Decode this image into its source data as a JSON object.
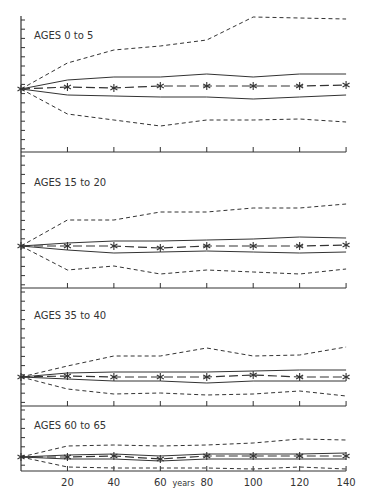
{
  "chart_data": {
    "type": "line",
    "title": "",
    "xlabel": "years",
    "ylabel": "",
    "x": [
      0,
      20,
      40,
      60,
      80,
      100,
      120,
      140
    ],
    "x_tick_labels": [
      "20",
      "40",
      "60",
      "80",
      "100",
      "120",
      "140"
    ],
    "xlim": [
      0,
      140
    ],
    "grid": false,
    "legend": null,
    "series_styles": {
      "mean": "long-dash with asterisk markers",
      "inner_band": "solid",
      "outer_band": "short-dash"
    },
    "panels": [
      {
        "label": "AGES 0 to 5",
        "note": "values are relative vertical offsets from origin (pixels, up positive)",
        "series": [
          {
            "name": "outer_upper",
            "values": [
              0,
              26,
              39,
              43,
              49,
              72,
              71,
              70
            ]
          },
          {
            "name": "inner_upper",
            "values": [
              0,
              9,
              12,
              12,
              15,
              12,
              15,
              15
            ]
          },
          {
            "name": "mean",
            "values": [
              0,
              2,
              1,
              3,
              3,
              3,
              3,
              4
            ]
          },
          {
            "name": "inner_lower",
            "values": [
              0,
              -6,
              -7,
              -8,
              -8,
              -10,
              -8,
              -6
            ]
          },
          {
            "name": "outer_lower",
            "values": [
              0,
              -25,
              -31,
              -37,
              -31,
              -31,
              -30,
              -33
            ]
          }
        ]
      },
      {
        "label": "AGES 15 to 20",
        "series": [
          {
            "name": "outer_upper",
            "values": [
              0,
              26,
              26,
              34,
              34,
              38,
              38,
              42
            ]
          },
          {
            "name": "inner_upper",
            "values": [
              0,
              3,
              5,
              5,
              6,
              7,
              9,
              8
            ]
          },
          {
            "name": "mean",
            "values": [
              0,
              0,
              0,
              -2,
              0,
              0,
              0,
              1
            ]
          },
          {
            "name": "inner_lower",
            "values": [
              0,
              -4,
              -7,
              -6,
              -5,
              -6,
              -7,
              -6
            ]
          },
          {
            "name": "outer_lower",
            "values": [
              0,
              -24,
              -20,
              -28,
              -24,
              -26,
              -28,
              -23
            ]
          }
        ]
      },
      {
        "label": "AGES 35 to 40",
        "series": [
          {
            "name": "outer_upper",
            "values": [
              0,
              11,
              21,
              21,
              29,
              21,
              22,
              30
            ]
          },
          {
            "name": "inner_upper",
            "values": [
              0,
              4,
              5,
              5,
              5,
              6,
              7,
              7
            ]
          },
          {
            "name": "mean",
            "values": [
              0,
              1,
              0,
              0,
              0,
              2,
              0,
              0
            ]
          },
          {
            "name": "inner_lower",
            "values": [
              0,
              -2,
              -4,
              -4,
              -6,
              -4,
              -4,
              -4
            ]
          },
          {
            "name": "outer_lower",
            "values": [
              0,
              -12,
              -17,
              -16,
              -18,
              -17,
              -14,
              -19
            ]
          }
        ]
      },
      {
        "label": "AGES 60 to 65",
        "series": [
          {
            "name": "outer_upper",
            "values": [
              0,
              11,
              12,
              11,
              12,
              14,
              18,
              17
            ]
          },
          {
            "name": "inner_upper",
            "values": [
              0,
              2,
              3,
              1,
              3,
              3,
              3,
              4
            ]
          },
          {
            "name": "mean",
            "values": [
              0,
              0,
              1,
              -2,
              1,
              1,
              1,
              1
            ]
          },
          {
            "name": "inner_lower",
            "values": [
              0,
              -2,
              -2,
              -4,
              -2,
              -2,
              -2,
              -2
            ]
          },
          {
            "name": "outer_lower",
            "values": [
              0,
              -10,
              -11,
              -11,
              -11,
              -12,
              -10,
              -12
            ]
          }
        ]
      }
    ]
  },
  "layout": {
    "x_axis_px": {
      "x0": 21,
      "px_per_unit": 2.322
    },
    "panels_px": [
      {
        "top": 16,
        "bottom": 152,
        "origin_y": 89,
        "label_y": 39
      },
      {
        "top": 152,
        "bottom": 288,
        "origin_y": 246,
        "label_y": 186
      },
      {
        "top": 288,
        "bottom": 406,
        "origin_y": 377,
        "label_y": 319
      },
      {
        "top": 406,
        "bottom": 471,
        "origin_y": 457,
        "label_y": 429
      }
    ],
    "ink_color": "#333333"
  }
}
